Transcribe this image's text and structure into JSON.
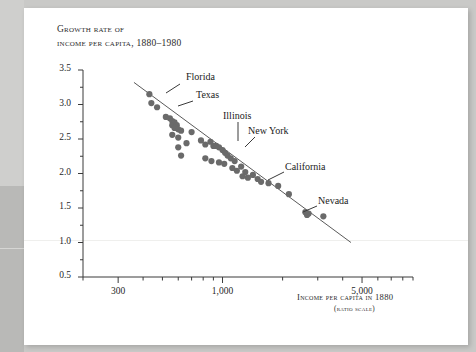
{
  "figure": {
    "title_line1": "Growth rate of",
    "title_line2": "income per capita, 1880–1980",
    "x_axis_title": "Income per capita in 1880",
    "x_axis_subtitle": "(ratio scale)"
  },
  "chart_data": {
    "type": "scatter",
    "title": "Growth rate of income per capita, 1880–1980",
    "xlabel": "Income per capita in 1880 (ratio scale)",
    "ylabel": "Growth rate of income per capita, 1880–1980",
    "x_scale": "log",
    "y_scale": "linear",
    "xlim": [
      200,
      9000
    ],
    "ylim": [
      0.5,
      3.5
    ],
    "grid": false,
    "legend": "none",
    "x_ticks_labeled": [
      {
        "value": 300,
        "label": "300"
      },
      {
        "value": 1000,
        "label": "1,000"
      },
      {
        "value": 5000,
        "label": "5,000"
      }
    ],
    "x_ticks_minor": [
      200,
      400,
      500,
      600,
      700,
      800,
      900,
      2000,
      3000,
      4000,
      6000,
      7000,
      8000,
      9000
    ],
    "y_ticks_labeled": [
      {
        "value": 3.5,
        "label": "3.5"
      },
      {
        "value": 3.0,
        "label": "3.0"
      },
      {
        "value": 2.5,
        "label": "2.5"
      },
      {
        "value": 2.0,
        "label": "2.0"
      },
      {
        "value": 1.5,
        "label": "1.5"
      },
      {
        "value": 1.0,
        "label": "1.0"
      },
      {
        "value": 0.5,
        "label": "0.5"
      }
    ],
    "y_ticks_minor": [
      0.75,
      1.25,
      1.75,
      2.25,
      2.75,
      3.25
    ],
    "series": [
      {
        "name": "U.S. states",
        "marker": "filled-circle",
        "color": "#6a6a6a",
        "points": [
          {
            "x": 430,
            "y": 3.15
          },
          {
            "x": 440,
            "y": 3.02
          },
          {
            "x": 470,
            "y": 2.96
          },
          {
            "x": 520,
            "y": 2.82
          },
          {
            "x": 545,
            "y": 2.8
          },
          {
            "x": 560,
            "y": 2.76
          },
          {
            "x": 575,
            "y": 2.74
          },
          {
            "x": 560,
            "y": 2.7
          },
          {
            "x": 590,
            "y": 2.7
          },
          {
            "x": 575,
            "y": 2.66
          },
          {
            "x": 600,
            "y": 2.64
          },
          {
            "x": 620,
            "y": 2.62
          },
          {
            "x": 560,
            "y": 2.56
          },
          {
            "x": 600,
            "y": 2.52
          },
          {
            "x": 700,
            "y": 2.6
          },
          {
            "x": 660,
            "y": 2.44
          },
          {
            "x": 600,
            "y": 2.38
          },
          {
            "x": 620,
            "y": 2.26
          },
          {
            "x": 780,
            "y": 2.48
          },
          {
            "x": 820,
            "y": 2.42
          },
          {
            "x": 870,
            "y": 2.46
          },
          {
            "x": 900,
            "y": 2.4
          },
          {
            "x": 930,
            "y": 2.4
          },
          {
            "x": 960,
            "y": 2.38
          },
          {
            "x": 1000,
            "y": 2.34
          },
          {
            "x": 1030,
            "y": 2.3
          },
          {
            "x": 820,
            "y": 2.22
          },
          {
            "x": 880,
            "y": 2.18
          },
          {
            "x": 960,
            "y": 2.16
          },
          {
            "x": 1020,
            "y": 2.14
          },
          {
            "x": 1060,
            "y": 2.26
          },
          {
            "x": 1100,
            "y": 2.22
          },
          {
            "x": 1150,
            "y": 2.18
          },
          {
            "x": 1120,
            "y": 2.08
          },
          {
            "x": 1180,
            "y": 2.04
          },
          {
            "x": 1240,
            "y": 2.1
          },
          {
            "x": 1300,
            "y": 2.02
          },
          {
            "x": 1260,
            "y": 1.96
          },
          {
            "x": 1340,
            "y": 1.94
          },
          {
            "x": 1420,
            "y": 1.98
          },
          {
            "x": 1500,
            "y": 1.92
          },
          {
            "x": 1560,
            "y": 1.88
          },
          {
            "x": 1700,
            "y": 1.86
          },
          {
            "x": 1900,
            "y": 1.82
          },
          {
            "x": 2150,
            "y": 1.7
          },
          {
            "x": 2600,
            "y": 1.44
          },
          {
            "x": 2650,
            "y": 1.4
          },
          {
            "x": 2700,
            "y": 1.42
          },
          {
            "x": 3200,
            "y": 1.38
          }
        ]
      }
    ],
    "trend_line": {
      "description": "negatively sloped fitted regression line (convergence)",
      "color": "#5a5a5a",
      "x_start": 360,
      "y_start": 3.32,
      "x_end": 4400,
      "y_end": 1.0
    },
    "annotations": [
      {
        "label": "Florida",
        "point_x": 470,
        "point_y": 2.96
      },
      {
        "label": "Texas",
        "point_x": 600,
        "point_y": 2.78
      },
      {
        "label": "Illinois",
        "point_x": 1060,
        "point_y": 2.26
      },
      {
        "label": "New York",
        "point_x": 1240,
        "point_y": 2.1
      },
      {
        "label": "California",
        "point_x": 1900,
        "point_y": 1.82
      },
      {
        "label": "Nevada",
        "point_x": 3200,
        "point_y": 1.38
      }
    ]
  }
}
